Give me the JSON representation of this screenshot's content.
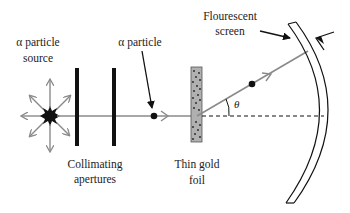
{
  "diagram": {
    "labels": {
      "source_line1": "α particle",
      "source_line2": "source",
      "particle": "α particle",
      "apertures_line1": "Collimating",
      "apertures_line2": "apertures",
      "foil_line1": "Thin gold",
      "foil_line2": "foil",
      "screen_line1": "Flourescent",
      "screen_line2": "screen",
      "angle": "θ"
    },
    "colors": {
      "beam": "#8a8a8a",
      "ink": "#111111",
      "foil_fill": "#b0b0b0",
      "background": "#ffffff"
    }
  }
}
